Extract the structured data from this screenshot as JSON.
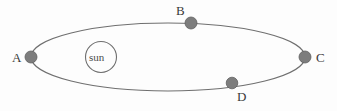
{
  "diagram": {
    "colors": {
      "background": "#fdfdfd",
      "orbit_stroke": "#6f6f6f",
      "planet_fill": "#7d7d7d",
      "planet_stroke": "#5f5f5f",
      "sun_stroke": "#6f6f6f",
      "label_text": "#3a3a3a"
    },
    "orbit": {
      "shape": "ellipse",
      "center_x": 168,
      "center_y": 57,
      "radius_x": 137,
      "radius_y": 34,
      "stroke_width": 1.1
    },
    "sun": {
      "label": "sun",
      "center_x": 101,
      "center_y": 57,
      "radius": 15.5,
      "stroke_width": 1.1
    },
    "points": [
      {
        "id": "A",
        "label": "A",
        "x": 31,
        "y": 57,
        "radius": 6.0
      },
      {
        "id": "B",
        "label": "B",
        "x": 191,
        "y": 23,
        "radius": 6.0
      },
      {
        "id": "C",
        "label": "C",
        "x": 305,
        "y": 57,
        "radius": 6.0
      },
      {
        "id": "D",
        "label": "D",
        "x": 232,
        "y": 83,
        "radius": 5.8
      }
    ]
  }
}
